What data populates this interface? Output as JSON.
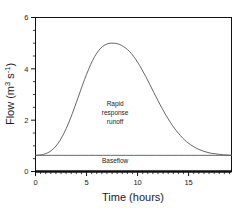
{
  "chart_data": {
    "type": "line",
    "title": "",
    "xlabel": "Time (hours)",
    "ylabel": "Flow (m s )",
    "ylabel_parts": {
      "main": "Flow (m",
      "sup1": "3",
      "mid": " s",
      "sup2": "-1",
      "tail": ")"
    },
    "xlim": [
      0,
      19.2
    ],
    "ylim": [
      0,
      6
    ],
    "grid": false,
    "legend": null,
    "xticks": [
      0,
      5,
      10,
      15
    ],
    "xtick_labels": [
      "0",
      "5",
      "10",
      "15"
    ],
    "xminor_tick_interval": 0.5,
    "yticks": [
      0,
      2,
      4,
      6
    ],
    "ytick_labels": [
      "0",
      "2",
      "4",
      "6"
    ],
    "yminor_tick_interval": 0.5,
    "annotations": [
      {
        "name": "rapid-response-runoff",
        "lines": [
          "Rapid",
          "response",
          "runoff"
        ],
        "x": 7.8,
        "y": 2.55
      },
      {
        "name": "baseflow",
        "lines": [
          "Baseflow"
        ],
        "x": 7.8,
        "y": 0.33
      }
    ],
    "series": [
      {
        "name": "Total hydrograph",
        "color": "#555555",
        "x": [
          0.0,
          0.4,
          0.8,
          1.2,
          1.6,
          2.0,
          2.4,
          2.8,
          3.2,
          3.6,
          4.0,
          4.4,
          4.8,
          5.2,
          5.6,
          6.0,
          6.4,
          6.8,
          7.2,
          7.6,
          8.0,
          8.4,
          8.8,
          9.2,
          9.6,
          10.0,
          10.4,
          10.8,
          11.2,
          11.6,
          12.0,
          12.4,
          12.8,
          13.2,
          13.6,
          14.0,
          14.4,
          14.8,
          15.2,
          15.6,
          16.0,
          16.4,
          16.8,
          17.2,
          17.6,
          18.0,
          18.4,
          18.8,
          19.2
        ],
        "y": [
          0.63,
          0.64,
          0.67,
          0.73,
          0.83,
          0.99,
          1.21,
          1.5,
          1.85,
          2.25,
          2.69,
          3.14,
          3.58,
          3.98,
          4.33,
          4.61,
          4.81,
          4.93,
          4.99,
          5.0,
          4.98,
          4.92,
          4.82,
          4.68,
          4.49,
          4.26,
          3.99,
          3.7,
          3.39,
          3.07,
          2.76,
          2.46,
          2.18,
          1.92,
          1.69,
          1.49,
          1.31,
          1.16,
          1.04,
          0.94,
          0.86,
          0.8,
          0.75,
          0.71,
          0.69,
          0.67,
          0.65,
          0.64,
          0.63
        ]
      },
      {
        "name": "Baseflow",
        "color": "#555555",
        "x": [
          0.0,
          19.2
        ],
        "y": [
          0.63,
          0.63
        ]
      }
    ]
  }
}
